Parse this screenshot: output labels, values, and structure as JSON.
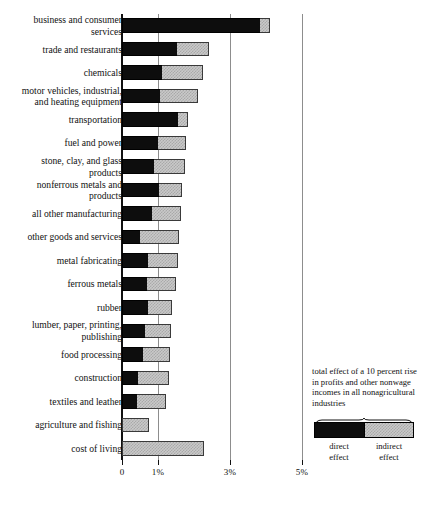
{
  "chart_data": {
    "type": "bar",
    "orientation": "horizontal",
    "stacked": true,
    "title": "",
    "xlabel": "",
    "ylabel": "",
    "xlim": [
      0,
      5.5
    ],
    "grid": true,
    "xticks": [
      {
        "value": 0,
        "label": "0"
      },
      {
        "value": 1,
        "label": "1%"
      },
      {
        "value": 3,
        "label": "3%"
      },
      {
        "value": 5,
        "label": "5%"
      }
    ],
    "legend": {
      "position": "bottom-right",
      "caption": "total effect of a 10 percent rise in profits and other nonwage incomes in all nonagricultural industries",
      "entries": [
        {
          "name": "direct effect",
          "label": "direct\neffect",
          "color": "#0d0d0d"
        },
        {
          "name": "indirect effect",
          "label": "indirect\neffect",
          "color": "#c9c9c9"
        }
      ]
    },
    "series": [
      {
        "name": "direct effect",
        "color": "#0d0d0d"
      },
      {
        "name": "indirect effect",
        "color": "#c9c9c9"
      }
    ],
    "categories": [
      "business and consumer\nservices",
      "trade and restaurants",
      "chemicals",
      "motor vehicles, industrial,\nand heating equipment",
      "transportation",
      "fuel and power",
      "stone, clay, and glass\nproducts",
      "nonferrous metals and\nproducts",
      "all other manufacturing",
      "other goods and services",
      "metal fabricating",
      "ferrous metals",
      "rubber",
      "lumber, paper, printing,\npublishing",
      "food processing",
      "construction",
      "textiles and leather",
      "agriculture and fishing",
      "cost of living"
    ],
    "rows": [
      {
        "category": "business and consumer\nservices",
        "direct": 3.84,
        "indirect": 0.28,
        "total": 4.12
      },
      {
        "category": "trade and restaurants",
        "direct": 1.53,
        "indirect": 0.89,
        "total": 2.42
      },
      {
        "category": "chemicals",
        "direct": 1.11,
        "indirect": 1.14,
        "total": 2.25
      },
      {
        "category": "motor vehicles, industrial,\nand heating equipment",
        "direct": 1.06,
        "indirect": 1.06,
        "total": 2.12
      },
      {
        "category": "transportation",
        "direct": 1.56,
        "indirect": 0.28,
        "total": 1.84
      },
      {
        "category": "fuel and power",
        "direct": 1.0,
        "indirect": 0.78,
        "total": 1.78
      },
      {
        "category": "stone, clay, and glass\nproducts",
        "direct": 0.89,
        "indirect": 0.86,
        "total": 1.75
      },
      {
        "category": "nonferrous metals and\nproducts",
        "direct": 1.03,
        "indirect": 0.64,
        "total": 1.67
      },
      {
        "category": "all other manufacturing",
        "direct": 0.83,
        "indirect": 0.81,
        "total": 1.64
      },
      {
        "category": "other goods and services",
        "direct": 0.5,
        "indirect": 1.08,
        "total": 1.58
      },
      {
        "category": "metal fabricating",
        "direct": 0.72,
        "indirect": 0.83,
        "total": 1.55
      },
      {
        "category": "ferrous metals",
        "direct": 0.69,
        "indirect": 0.81,
        "total": 1.5
      },
      {
        "category": "rubber",
        "direct": 0.72,
        "indirect": 0.67,
        "total": 1.39
      },
      {
        "category": "lumber, paper, printing,\npublishing",
        "direct": 0.64,
        "indirect": 0.72,
        "total": 1.36
      },
      {
        "category": "food processing",
        "direct": 0.58,
        "indirect": 0.75,
        "total": 1.33
      },
      {
        "category": "construction",
        "direct": 0.44,
        "indirect": 0.86,
        "total": 1.3
      },
      {
        "category": "textiles and leather",
        "direct": 0.42,
        "indirect": 0.81,
        "total": 1.23
      },
      {
        "category": "agriculture and fishing",
        "direct": 0.0,
        "indirect": 0.75,
        "total": 0.75
      },
      {
        "category": "cost of living",
        "direct": 0.0,
        "indirect": 2.28,
        "total": 2.28
      }
    ]
  }
}
